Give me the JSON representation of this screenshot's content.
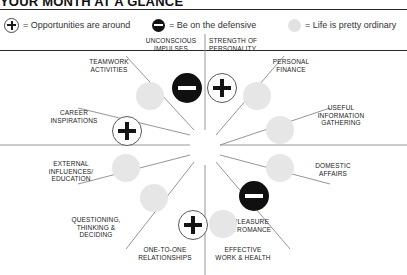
{
  "header": {
    "title": "Your Month at a Glance"
  },
  "legend": {
    "items": [
      {
        "marker": "plus-icon",
        "marker_type": "plus",
        "equals": "= Opportunities are around"
      },
      {
        "marker": "minus-icon",
        "marker_type": "minus",
        "equals": "= Be on the defensive"
      },
      {
        "marker": "ordinary-icon",
        "marker_type": "ordinary",
        "equals": "= Life is pretty ordinary"
      }
    ]
  },
  "wheel": {
    "sectors": [
      {
        "id": "unconscious-impulses",
        "label": "Unconscious\nImpulses",
        "marker_type": "minus"
      },
      {
        "id": "strength-of-personality",
        "label": "Strength of\nPersonality",
        "marker_type": "plus"
      },
      {
        "id": "personal-finance",
        "label": "Personal\nFinance",
        "marker_type": "ordinary"
      },
      {
        "id": "useful-information-gathering",
        "label": "Useful\nInformation\nGathering",
        "marker_type": "ordinary"
      },
      {
        "id": "domestic-affairs",
        "label": "Domestic\nAffairs",
        "marker_type": "ordinary"
      },
      {
        "id": "pleasure-and-romance",
        "label": "Pleasure\n& Romance",
        "marker_type": "minus"
      },
      {
        "id": "effective-work-and-health",
        "label": "Effective\nWork & Health",
        "marker_type": "ordinary"
      },
      {
        "id": "one-to-one-relationships",
        "label": "One-to-One\nRelationships",
        "marker_type": "plus"
      },
      {
        "id": "questioning-thinking-deciding",
        "label": "Questioning,\nThinking &\nDeciding",
        "marker_type": "ordinary"
      },
      {
        "id": "external-influences-education",
        "label": "External\nInfluences/\nEducation",
        "marker_type": "ordinary"
      },
      {
        "id": "career-inspirations",
        "label": "Career\nInspirations",
        "marker_type": "plus"
      },
      {
        "id": "teamwork-activities",
        "label": "Teamwork\nActivities",
        "marker_type": "ordinary"
      }
    ]
  },
  "colors": {
    "ink": "#1b1b1b",
    "rule": "#2b2b2b",
    "spoke": "#8a8a8a",
    "negative_fill": "#101010",
    "ordinary_fill": "#e6e6e6",
    "paper": "#ffffff"
  }
}
